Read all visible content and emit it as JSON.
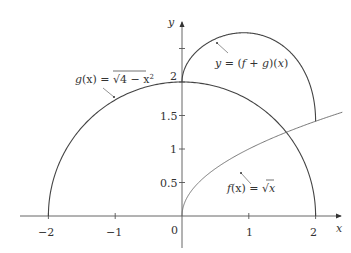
{
  "chart_data": {
    "type": "line",
    "title": "",
    "xlabel": "x",
    "ylabel": "y",
    "xlim": [
      -2.05,
      2.4
    ],
    "ylim": [
      0,
      2.8
    ],
    "grid": false,
    "legend": "none",
    "x_ticks": [
      -2,
      -1,
      0,
      1,
      2
    ],
    "x_tick_labels": [
      "−2",
      "−1",
      "0",
      "1",
      "2"
    ],
    "y_ticks": [
      0.5,
      1,
      1.5,
      2,
      2.5
    ],
    "y_tick_labels": [
      "0.5",
      "1",
      "1.5",
      "2",
      ""
    ],
    "series": [
      {
        "name": "g(x) = √(4 − x²)",
        "expr": "sqrt(4 - x^2)",
        "domain": [
          -2,
          2
        ],
        "x": [
          -2,
          -1.5,
          -1,
          -0.5,
          0,
          0.5,
          1,
          1.5,
          2
        ],
        "values": [
          0,
          1.32,
          1.73,
          1.94,
          2,
          1.94,
          1.73,
          1.32,
          0
        ]
      },
      {
        "name": "f(x) = √x",
        "expr": "sqrt(x)",
        "domain": [
          0,
          2.4
        ],
        "x": [
          0,
          0.5,
          1,
          1.5,
          2,
          2.4
        ],
        "values": [
          0,
          0.71,
          1,
          1.22,
          1.41,
          1.55
        ]
      },
      {
        "name": "y = (f + g)(x)",
        "expr": "sqrt(x) + sqrt(4 - x^2)",
        "domain": [
          0,
          2
        ],
        "x": [
          0,
          0.25,
          0.5,
          0.75,
          1,
          1.25,
          1.5,
          1.75,
          2
        ],
        "values": [
          2,
          2.48,
          2.64,
          2.72,
          2.73,
          2.68,
          2.55,
          2.29,
          1.41
        ]
      }
    ],
    "annotations": [
      {
        "text": "g(x) = √(4 − x²)",
        "points_to": "g"
      },
      {
        "text": "y = (f + g)(x)",
        "points_to": "f+g"
      },
      {
        "text": "f(x) = √x",
        "points_to": "f"
      }
    ]
  },
  "labels": {
    "x_axis": "x",
    "y_axis": "y",
    "xt_m2": "−2",
    "xt_m1": "−1",
    "xt_0": "0",
    "xt_1": "1",
    "xt_2": "2",
    "yt_05": "0.5",
    "yt_1": "1",
    "yt_15": "1.5",
    "yt_2": "2",
    "g_name": "g",
    "g_arg": "(x)",
    "g_eq": " = ",
    "g_body": "4 − x",
    "g_exp": "2",
    "f_name": "f",
    "f_arg": "(x)",
    "f_eq": " = ",
    "f_body": "x",
    "fg_y": "y",
    "fg_eq": " = (",
    "fg_f": "f",
    "fg_plus": " + ",
    "fg_g": "g",
    "fg_close": ")(",
    "fg_x": "x",
    "fg_end": ")"
  }
}
